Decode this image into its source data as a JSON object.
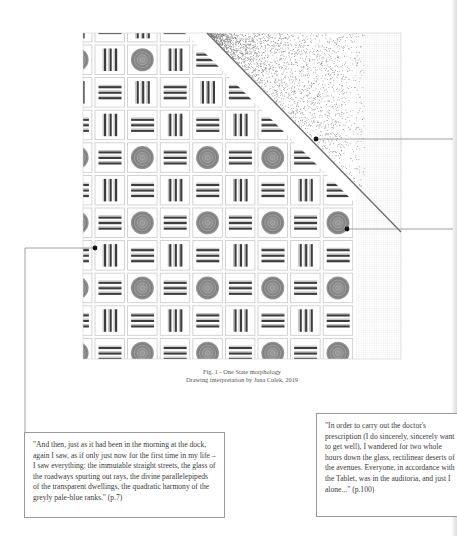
{
  "figure": {
    "caption_line1": "Fig. 1 - One State morphology",
    "caption_line2": "Drawing interpretation by Jana Culek, 2019",
    "bounds": {
      "left": 83,
      "top": 33,
      "right": 401,
      "bottom": 359
    },
    "grid": {
      "pitch": 32.6,
      "cell_size": 29.5,
      "first_col_x": 95,
      "first_row_y": 45,
      "grid_right": 356,
      "legend": {
        "C": "concentric-circle-cell",
        "V": "vertical-bars-cell",
        "H": "horizontal-bars-cell"
      },
      "rows": [
        [
          "V",
          "H",
          "V",
          "H",
          "V",
          "H",
          "V",
          "H",
          "V"
        ],
        [
          "C",
          "V",
          "C",
          "V",
          "H",
          "V",
          "H",
          "V",
          "H"
        ],
        [
          "V",
          "H",
          "V",
          "H",
          "V",
          "H",
          "V",
          "H",
          "V"
        ],
        [
          "H",
          "V",
          "H",
          "V",
          "H",
          "V",
          "H",
          "V",
          "H"
        ],
        [
          "C",
          "H",
          "C",
          "H",
          "C",
          "H",
          "C",
          "H",
          "C"
        ],
        [
          "H",
          "V",
          "H",
          "V",
          "H",
          "V",
          "H",
          "V",
          "H"
        ],
        [
          "C",
          "H",
          "C",
          "H",
          "C",
          "H",
          "C",
          "H",
          "C"
        ],
        [
          "H",
          "V",
          "H",
          "V",
          "H",
          "V",
          "H",
          "V",
          "H"
        ],
        [
          "C",
          "H",
          "C",
          "H",
          "C",
          "H",
          "C",
          "H",
          "C"
        ],
        [
          "H",
          "V",
          "H",
          "V",
          "H",
          "V",
          "H",
          "V",
          "H"
        ],
        [
          "C",
          "H",
          "C",
          "H",
          "C",
          "H",
          "C",
          "H",
          "C"
        ]
      ]
    },
    "diagonal": {
      "x1": 207,
      "y1": 33,
      "x2": 401,
      "y2": 232
    },
    "annotations": [
      {
        "id": "right-upper",
        "dot": [
          316,
          139
        ],
        "to": [
          453,
          139
        ]
      },
      {
        "id": "right-lower",
        "dot": [
          347,
          229
        ],
        "to": [
          453,
          229
        ]
      },
      {
        "id": "left",
        "dot": [
          95,
          248
        ],
        "path": [
          [
            95,
            248
          ],
          [
            25,
            248
          ],
          [
            25,
            432
          ]
        ]
      }
    ],
    "colors": {
      "cell_border": "#c9c9c9",
      "bar": "#3d3d3d",
      "circle": "#8a8a8a",
      "line": "#6e6e6e",
      "dot": "#111111"
    }
  },
  "quotes": {
    "left": "\"And then, just as it had been in the morning at the dock, again I saw, as if only just now for the first time in my life – I saw everything: the immutable straight streets, the glass of the roadways spurting out rays, the divine parallelepipeds of the transparent dwellings, the quadratic harmony of the greyly pale-blue ranks.\" (p.7)",
    "right": "\"In order to carry out the doctor's prescription (I do sincerely, sincerely want to get well), I wandered for two whole hours down the glass, rectilinear deserts of the avenues. Everyone, in accordance with the Tablet, was in the auditoria, and just I alone...\" (p.100)"
  }
}
